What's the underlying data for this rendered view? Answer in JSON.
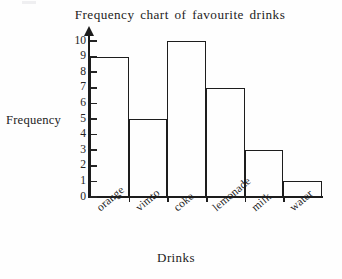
{
  "chart_data": {
    "type": "bar",
    "title": "Frequency chart of favourite drinks",
    "xlabel": "Drinks",
    "ylabel": "Frequency",
    "categories": [
      "orange",
      "vimto",
      "coke",
      "lemonade",
      "milk",
      "water"
    ],
    "values": [
      9,
      5,
      10,
      7,
      3,
      1
    ],
    "ylim": [
      0,
      10
    ],
    "ytick_labels": [
      "0",
      "1",
      "2",
      "3",
      "4",
      "5",
      "6",
      "7",
      "8",
      "9",
      "10"
    ],
    "ytick_values": [
      0,
      1,
      2,
      3,
      4,
      5,
      6,
      7,
      8,
      9,
      10
    ],
    "grid": false,
    "legend": "none",
    "bar_style": {
      "fill": "none",
      "stroke": "#1d1d1d"
    },
    "axis_color": "#1c1c1c",
    "background": "#fefefe"
  }
}
